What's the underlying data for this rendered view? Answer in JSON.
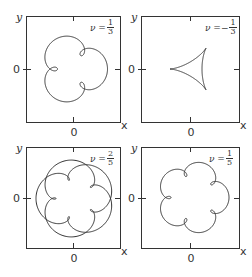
{
  "figure": {
    "axis_labels": {
      "x": "x",
      "y": "y",
      "origin_tick": "0"
    },
    "line_color": "#333333",
    "panels": [
      {
        "id": "top-left",
        "nu_prefix": "ν =",
        "nu_sign": "",
        "nu_num": "1",
        "nu_den": "3",
        "box": [
          26,
          16,
          120,
          122
        ],
        "curve": {
          "type": "trochoid",
          "k1": 1,
          "k2": 4,
          "a": 25,
          "b": -9.5,
          "rot": 180,
          "cx": 0,
          "cy": 0,
          "turns": 1
        }
      },
      {
        "id": "top-right",
        "nu_prefix": "ν =",
        "nu_sign": "−",
        "nu_num": "1",
        "nu_den": "3",
        "box": [
          141,
          16,
          239,
          122
        ],
        "curve": {
          "type": "trochoid",
          "k1": 1,
          "k2": -2,
          "a": 16,
          "b": 8,
          "rot": 180,
          "cx": 4,
          "cy": 0,
          "turns": 1
        }
      },
      {
        "id": "bottom-left",
        "nu_prefix": "ν =",
        "nu_sign": "",
        "nu_num": "2",
        "nu_den": "5",
        "box": [
          26,
          147,
          120,
          248
        ],
        "curve": {
          "type": "trochoid",
          "k1": 2,
          "k2": 7,
          "a": 29,
          "b": -10,
          "rot": 180,
          "cx": 2,
          "cy": 1,
          "turns": 1
        }
      },
      {
        "id": "bottom-right",
        "nu_prefix": "ν =",
        "nu_sign": "",
        "nu_num": "1",
        "nu_den": "5",
        "box": [
          141,
          147,
          239,
          248
        ],
        "curve": {
          "type": "trochoid",
          "k1": 1,
          "k2": 6,
          "a": 29,
          "b": -7,
          "rot": 180,
          "cx": 3,
          "cy": 0,
          "turns": 1
        }
      }
    ]
  },
  "chart_data": [
    {
      "type": "line",
      "title": "ν = 1/3",
      "xlabel": "x",
      "ylabel": "y",
      "x_ticks": [
        "0"
      ],
      "y_ticks": [
        "0"
      ],
      "grid": false,
      "description": "closed curve with 3 outer lobes and 3 small inner loops"
    },
    {
      "type": "line",
      "title": "ν = −1/3",
      "xlabel": "x",
      "ylabel": "y",
      "x_ticks": [
        "0"
      ],
      "y_ticks": [
        "0"
      ],
      "grid": false,
      "description": "triangular curve with concave sides (3 vertices)"
    },
    {
      "type": "line",
      "title": "ν = 2/5",
      "xlabel": "x",
      "ylabel": "y",
      "x_ticks": [
        "0"
      ],
      "y_ticks": [
        "0"
      ],
      "grid": false,
      "description": "closed curve winding twice, 5 inner loops and 5 outer arcs"
    },
    {
      "type": "line",
      "title": "ν = 1/5",
      "xlabel": "x",
      "ylabel": "y",
      "x_ticks": [
        "0"
      ],
      "y_ticks": [
        "0"
      ],
      "grid": false,
      "description": "closed curve with 5 outer lobes and 5 small inner loops"
    }
  ]
}
